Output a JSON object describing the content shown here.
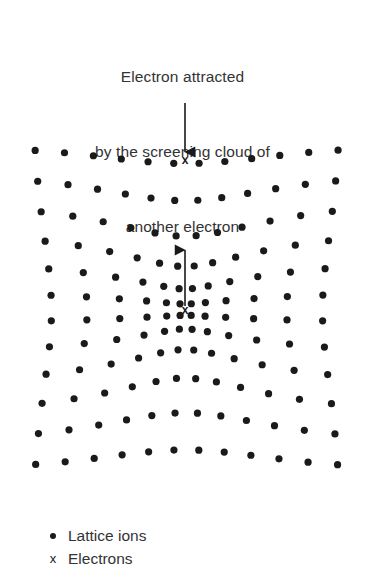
{
  "figure": {
    "title_lines": [
      "Electron attracted",
      "by the screening cloud of",
      "another electron"
    ],
    "background_color": "#ffffff",
    "ion_color": "#1a1a1a",
    "text_color": "#333333",
    "arrow_color": "#1a1a1a"
  },
  "legend": {
    "items": [
      {
        "marker": "dot-marker",
        "label": "Lattice ions"
      },
      {
        "marker": "x-marker",
        "label": "Electrons"
      }
    ]
  },
  "annotations": {
    "electron_markers": [
      {
        "name": "incoming-electron",
        "glyph": "x",
        "x": 185,
        "y": 161
      },
      {
        "name": "screening-cloud-electron",
        "glyph": "x",
        "x": 185,
        "y": 311
      }
    ],
    "arrows": [
      {
        "name": "downward-arrow",
        "direction": "down",
        "x": 185,
        "y_from": 103,
        "y_to": 152
      },
      {
        "name": "upward-arrow",
        "direction": "up",
        "x": 185,
        "y_from": 306,
        "y_to": 250
      }
    ]
  },
  "chart_data": {
    "type": "scatter",
    "title": "Electron attracted by the screening cloud of another electron",
    "xlabel": "",
    "ylabel": "",
    "grid": false,
    "legend_position": "bottom-left",
    "xlim": [
      20,
      350
    ],
    "ylim": [
      140,
      470
    ],
    "lattice": {
      "rows": 12,
      "cols": 12,
      "x_start": 32,
      "y_start": 147,
      "x_spacing": 28.1,
      "y_spacing": 29.2,
      "dot_diameter": 7.2,
      "distortion": {
        "model": "radial-inward-gaussian",
        "center_x": 185,
        "center_y": 311,
        "amplitude": 0.62,
        "sigma": 86
      }
    },
    "series": [
      {
        "name": "Lattice ions",
        "marker": "filled-circle",
        "color": "#1a1a1a",
        "count": 144
      },
      {
        "name": "Electrons",
        "marker": "x",
        "color": "#1a1a1a",
        "count": 2,
        "points": [
          {
            "x": 185,
            "y": 161
          },
          {
            "x": 185,
            "y": 311
          }
        ]
      }
    ]
  }
}
